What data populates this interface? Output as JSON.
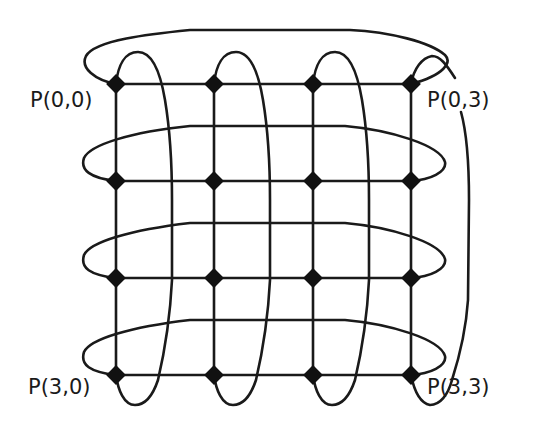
{
  "diagram": {
    "type": "mesh-with-wraparound",
    "rows": 4,
    "cols": 4,
    "line_color": "#1a1a1a",
    "background": "#ffffff",
    "labels": {
      "top_left": "P(0,0)",
      "top_right": "P(0,3)",
      "bottom_left": "P(3,0)",
      "bottom_right": "P(3,3)"
    },
    "node_x": [
      116,
      214,
      313,
      411
    ],
    "node_y": [
      84,
      181,
      278,
      375
    ]
  }
}
